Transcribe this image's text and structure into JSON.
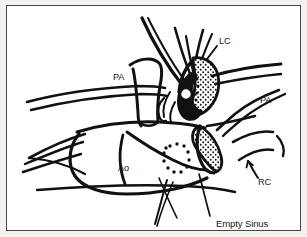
{
  "figure": {
    "kind": "line-drawing",
    "background_color": "#ffffff",
    "page_color": "#f2f2f0",
    "ink_color": "#111111",
    "border_color": "#4a4a4a",
    "labels": [
      {
        "id": "lc",
        "text": "LC",
        "meaning": "left coronary",
        "x": 212,
        "y": 38,
        "has_leader": true
      },
      {
        "id": "pa-left",
        "text": "PA",
        "meaning": "pulmonary artery",
        "x": 106,
        "y": 74,
        "has_leader": false
      },
      {
        "id": "pa-right",
        "text": "PA",
        "meaning": "pulmonary artery",
        "x": 253,
        "y": 97,
        "has_leader": false
      },
      {
        "id": "ao",
        "text": "Ao",
        "meaning": "aorta",
        "x": 111,
        "y": 165,
        "has_leader": false
      },
      {
        "id": "rc",
        "text": "RC",
        "meaning": "right coronary",
        "x": 251,
        "y": 179,
        "has_leader": true
      },
      {
        "id": "empty-sinus",
        "text": "Empty Sinus",
        "meaning": "empty coronary sinus of Valsalva",
        "x": 209,
        "y": 221,
        "has_leader": true
      }
    ],
    "structures": [
      {
        "id": "aortic-root-outline",
        "name": "aortic-root-outline"
      },
      {
        "id": "pulmonary-trunk-left",
        "name": "pulmonary-trunk-left"
      },
      {
        "id": "stippled-sinus-upper",
        "name": "stippled-sinus-upper"
      },
      {
        "id": "stippled-sinus-lower",
        "name": "stippled-sinus-lower"
      },
      {
        "id": "dotted-ellipse",
        "name": "dotted-ellipse"
      },
      {
        "id": "catheter-lines",
        "name": "catheter-lines"
      },
      {
        "id": "coronary-ostium-circle",
        "name": "coronary-ostium-circle"
      }
    ]
  }
}
